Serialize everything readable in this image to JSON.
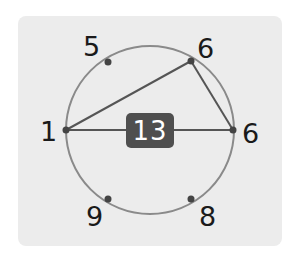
{
  "diagram": {
    "center_value": "13",
    "circle": {
      "cx": 150,
      "cy": 130,
      "r": 84
    },
    "points": [
      {
        "id": "top-left",
        "label": "5",
        "x": 108,
        "y": 62,
        "label_x": 83,
        "label_y": 33
      },
      {
        "id": "top-right",
        "label": "6",
        "x": 191,
        "y": 61,
        "label_x": 197,
        "label_y": 35
      },
      {
        "id": "left",
        "label": "1",
        "x": 66,
        "y": 130,
        "label_x": 40,
        "label_y": 118
      },
      {
        "id": "right",
        "label": "6",
        "x": 233,
        "y": 130,
        "label_x": 242,
        "label_y": 120
      },
      {
        "id": "bottom-left",
        "label": "9",
        "x": 108,
        "y": 199,
        "label_x": 86,
        "label_y": 203
      },
      {
        "id": "bottom-right",
        "label": "8",
        "x": 191,
        "y": 199,
        "label_x": 199,
        "label_y": 203
      }
    ],
    "segments": [
      {
        "from": "left",
        "to": "right"
      },
      {
        "from": "left",
        "to": "top-right"
      },
      {
        "from": "top-right",
        "to": "right"
      }
    ],
    "colors": {
      "panel": "#ececec",
      "circle": "#8a8a8a",
      "line": "#555555",
      "dot": "#444444",
      "badge": "#4f4f4f",
      "badge_text": "#ffffff",
      "label": "#1a1a1a"
    }
  }
}
